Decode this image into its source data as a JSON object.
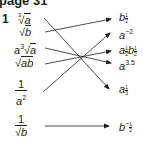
{
  "header": {
    "title": "page 31"
  },
  "question": {
    "number": "1"
  },
  "left_items": [
    {
      "id": "cbrt-a",
      "text": "∛a"
    },
    {
      "id": "sqrt-b",
      "text": "√b"
    },
    {
      "id": "a3-sqrt-a",
      "text": "a³√a"
    },
    {
      "id": "sqrt-ab",
      "text": "√ab"
    },
    {
      "id": "one-over-a2",
      "numerator": "1",
      "denominator": "a²"
    },
    {
      "id": "one-over-sqrt-b",
      "numerator": "1",
      "denominator": "√b"
    }
  ],
  "right_items": [
    {
      "id": "b-half",
      "base": "b",
      "exp": "1/2"
    },
    {
      "id": "a-neg2",
      "base": "a",
      "exp": "−2"
    },
    {
      "id": "a-half-b-half",
      "text": "a^(1/2) b^(1/2)"
    },
    {
      "id": "a-3.5",
      "base": "a",
      "exp": "3.5"
    },
    {
      "id": "a-third",
      "base": "a",
      "exp": "1/3"
    },
    {
      "id": "b-neg-half",
      "base": "b",
      "exp": "−1/2"
    }
  ],
  "matches": [
    {
      "from": "cbrt-a",
      "to": "a-third"
    },
    {
      "from": "sqrt-b",
      "to": "b-half"
    },
    {
      "from": "a3-sqrt-a",
      "to": "a-3.5"
    },
    {
      "from": "sqrt-ab",
      "to": "a-half-b-half"
    },
    {
      "from": "one-over-a2",
      "to": "a-neg2"
    },
    {
      "from": "one-over-sqrt-b",
      "to": "b-neg-half"
    }
  ],
  "labels": {
    "one": "1",
    "a": "a",
    "b": "b",
    "ab": "ab",
    "three": "3",
    "two": "2",
    "half_n": "1",
    "half_d": "2",
    "third_n": "1",
    "third_d": "3",
    "neg2": "−2",
    "exp35": "3.5",
    "neg": "−"
  }
}
